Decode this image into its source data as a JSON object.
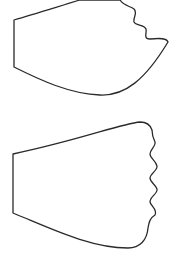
{
  "canvas": {
    "width": 182,
    "height": 260,
    "background": "#ffffff"
  },
  "shapes": [
    {
      "name": "top-template-shape",
      "stroke": "#2a2a2a",
      "path": "M14,20 L14,67 C40,80 70,94 100,95 C125,96 145,80 168,42 C167,38 160,38 150,39 C143,39 147,33 146,29 C144,24 136,26 134,22 C133,17 138,13 134,9 C130,6 124,6 120,0 L80,0 C60,6 35,14 14,20 Z"
    },
    {
      "name": "bottom-template-shape",
      "stroke": "#2a2a2a",
      "path": "M13,154 L13,213 C50,228 90,248 128,248 C140,248 147,240 148,228 C149,222 150,218 155,215 C158,210 151,206 150,202 C150,196 158,194 157,189 C155,184 150,182 150,178 C150,174 158,170 157,166 C156,161 150,158 150,154 C150,150 156,146 155,142 C153,138 152,134 152,130 C150,124 146,122 140,122 C120,124 80,140 13,154 Z"
    }
  ]
}
